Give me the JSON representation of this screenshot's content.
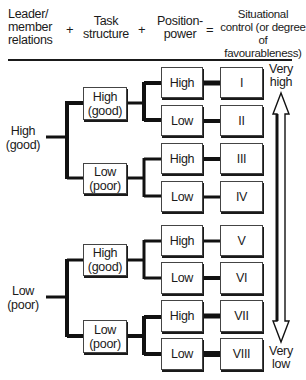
{
  "header": {
    "col1": "Leader/\nmember\nrelations",
    "col1_lines": [
      "Leader/",
      "member",
      "relations"
    ],
    "plus1": "+",
    "col2_lines": [
      "Task",
      "structure"
    ],
    "plus2": "+",
    "col3_lines": [
      "Position-",
      "power"
    ],
    "equals": "=",
    "col4_lines": [
      "Situational",
      "control (or degree",
      "of favourableness)"
    ]
  },
  "tree": {
    "leader_member": [
      {
        "line1": "High",
        "line2": "(good)"
      },
      {
        "line1": "Low",
        "line2": "(poor)"
      }
    ],
    "task_structure": [
      {
        "line1": "High",
        "line2": "(good)"
      },
      {
        "line1": "Low",
        "line2": "(poor)"
      },
      {
        "line1": "High",
        "line2": "(good)"
      },
      {
        "line1": "Low",
        "line2": "(poor)"
      }
    ],
    "position_power": [
      "High",
      "Low",
      "High",
      "Low",
      "High",
      "Low",
      "High",
      "Low"
    ],
    "situations": [
      "I",
      "II",
      "III",
      "IV",
      "V",
      "VI",
      "VII",
      "VIII"
    ]
  },
  "scale": {
    "top_lines": [
      "Very",
      "high"
    ],
    "bottom_lines": [
      "Very",
      "low"
    ],
    "icon": "double-headed-vertical-arrow"
  }
}
